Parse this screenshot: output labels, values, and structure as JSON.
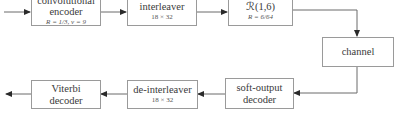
{
  "blocks": {
    "encoder": {
      "line1": "convolutional",
      "line2": "encoder",
      "sub": "R = 1/3, ν = 9"
    },
    "interleaver": {
      "label": "interleaver",
      "sub": "18 × 32"
    },
    "rm_code": {
      "label": "ℛ(1,6)",
      "sub": "R = 6/64"
    },
    "channel": {
      "label": "channel"
    },
    "soft_decoder": {
      "line1": "soft-output",
      "line2": "decoder"
    },
    "deinterleaver": {
      "label": "de-interleaver",
      "sub": "18 × 32"
    },
    "viterbi": {
      "line1": "Viterbi",
      "line2": "decoder"
    }
  },
  "colors": {
    "line": "#4a4a4a",
    "border": "#9a9a9a"
  }
}
